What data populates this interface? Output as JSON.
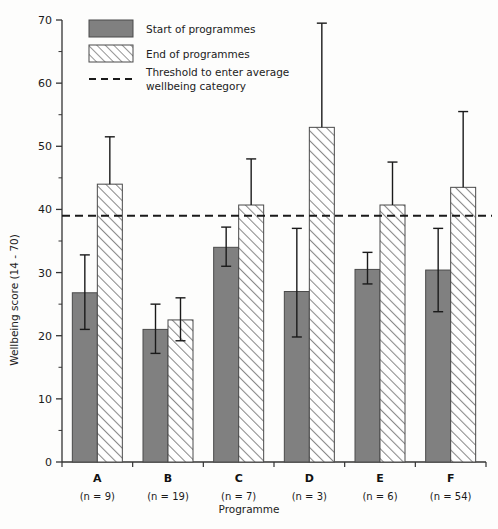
{
  "chart_data": {
    "type": "bar",
    "title": "",
    "xlabel": "Programme",
    "ylabel": "Wellbeing score (14 - 70)",
    "ylim": [
      0,
      70
    ],
    "ytick_step": 10,
    "yminor_step": 5,
    "grid": false,
    "legend_position": "top-left",
    "categories": [
      "A",
      "B",
      "C",
      "D",
      "E",
      "F"
    ],
    "category_sublabels": [
      "(n = 9)",
      "(n = 19)",
      "(n = 7)",
      "(n = 3)",
      "(n = 6)",
      "(n = 54)"
    ],
    "sample_sizes": [
      9,
      19,
      7,
      3,
      6,
      54
    ],
    "ytick_labels": [
      "0",
      "10",
      "20",
      "30",
      "40",
      "50",
      "60",
      "70"
    ],
    "ytick_values": [
      0,
      10,
      20,
      30,
      40,
      50,
      60,
      70
    ],
    "series": [
      {
        "name": "Start of programmes",
        "style": "solid-gray",
        "color": "#808080",
        "values": [
          26.8,
          21.0,
          34.0,
          27.0,
          30.5,
          30.4
        ],
        "err_low": [
          21.0,
          17.2,
          31.0,
          19.8,
          28.2,
          23.8
        ],
        "err_high": [
          32.8,
          25.0,
          37.2,
          37.0,
          33.2,
          37.0
        ]
      },
      {
        "name": "End of programmes",
        "style": "hatched",
        "color": "#ffffff",
        "values": [
          44.0,
          22.5,
          40.7,
          53.0,
          40.7,
          43.5
        ],
        "err_low": [
          44.0,
          19.2,
          40.7,
          53.0,
          40.7,
          43.5
        ],
        "err_high": [
          51.5,
          26.0,
          48.0,
          69.5,
          47.5,
          55.5
        ]
      }
    ],
    "threshold": {
      "label": "Threshold to enter average wellbeing category",
      "value": 39,
      "style": "dashed"
    }
  },
  "legend": {
    "items": [
      {
        "label": "Start of programmes",
        "swatch": "solid-gray-swatch"
      },
      {
        "label": "End of programmes",
        "swatch": "hatched-swatch"
      }
    ],
    "threshold_label_line1": "Threshold to enter average",
    "threshold_label_line2": "wellbeing category",
    "threshold_swatch": "dashed-line-swatch"
  },
  "colors": {
    "bar_fill": "#808080",
    "bar_stroke": "#4a4a4a",
    "hatch_stroke": "#8a8a8a",
    "axis": "#333333",
    "error_bar": "#1a1a1a",
    "background": "#fdfdfc"
  }
}
